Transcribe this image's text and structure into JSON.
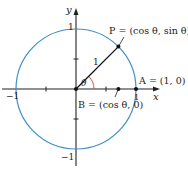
{
  "diagram": {
    "type": "unit-circle",
    "colors": {
      "circle": "#3d8fc6",
      "axes": "#222222",
      "radius": "#111111",
      "angle_arc": "#d9534f",
      "text": "#222222"
    },
    "axes": {
      "x_label": "x",
      "y_label": "y",
      "ticks": {
        "x_neg_one": "−1",
        "x_pos_one": "1",
        "y_pos_one": "1",
        "y_neg_one": "−1"
      }
    },
    "points": {
      "P": {
        "label": "P = (cos θ, sin θ)"
      },
      "A": {
        "label": "A = (1, 0)"
      },
      "B": {
        "label": "B = (cos θ, 0)"
      }
    },
    "radius_label": "1",
    "angle_label": "θ"
  }
}
